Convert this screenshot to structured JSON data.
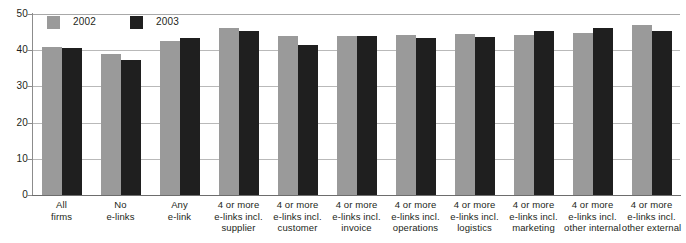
{
  "chart_data": {
    "type": "bar",
    "title": "",
    "xlabel": "",
    "ylabel": "",
    "ylim": [
      0,
      50
    ],
    "yticks": [
      0,
      10,
      20,
      30,
      40,
      50
    ],
    "ytick_labels": [
      "0",
      "10",
      "20",
      "30",
      "40",
      "50"
    ],
    "grid": true,
    "legend_position": "top-left",
    "categories": [
      "All\nfirms",
      "No\ne-links",
      "Any\ne-link",
      "4 or more\ne-links incl.\nsupplier",
      "4 or more\ne-links incl.\ncustomer",
      "4 or more\ne-links incl.\ninvoice",
      "4 or more\ne-links incl.\noperations",
      "4 or more\ne-links incl.\nlogistics",
      "4 or more\ne-links incl.\nmarketing",
      "4 or more\ne-links incl.\nother internal",
      "4 or more\ne-links incl.\nother external"
    ],
    "series": [
      {
        "name": "2002",
        "color": "#9a9a9a",
        "values": [
          41.0,
          39.0,
          42.5,
          46.2,
          44.0,
          44.0,
          44.3,
          44.5,
          44.3,
          44.8,
          47.0
        ]
      },
      {
        "name": "2003",
        "color": "#1f1f1f",
        "values": [
          40.5,
          37.2,
          43.4,
          45.2,
          41.5,
          44.0,
          43.5,
          43.7,
          45.3,
          46.2,
          45.2
        ]
      }
    ]
  },
  "legend": {
    "items": [
      {
        "label": "2002"
      },
      {
        "label": "2003"
      }
    ]
  },
  "axis": {
    "y_labels": [
      "50",
      "40",
      "30",
      "20",
      "10",
      "0"
    ]
  },
  "clipped_header": ""
}
